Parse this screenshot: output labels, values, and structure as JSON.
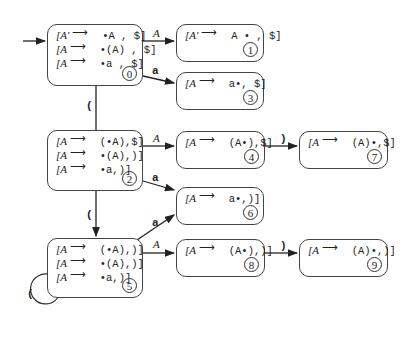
{
  "diagram": {
    "type": "LR(1) automaton",
    "states": [
      {
        "id": 0,
        "number": "0",
        "items": [
          {
            "lhs": "[A′",
            "rhs": "•A , $]"
          },
          {
            "lhs": "[A",
            "rhs": "•(A) , $]"
          },
          {
            "lhs": "[A",
            "rhs": "•a , $]"
          }
        ]
      },
      {
        "id": 1,
        "number": "1",
        "items": [
          {
            "lhs": "[A′",
            "rhs": "A • , $]"
          }
        ]
      },
      {
        "id": 2,
        "number": "2",
        "items": [
          {
            "lhs": "[A",
            "rhs": "(•A),$]"
          },
          {
            "lhs": "[A",
            "rhs": "•(A),)]"
          },
          {
            "lhs": "[A",
            "rhs": "•a,)]"
          }
        ]
      },
      {
        "id": 3,
        "number": "3",
        "items": [
          {
            "lhs": "[A",
            "rhs": "a•, $]"
          }
        ]
      },
      {
        "id": 4,
        "number": "4",
        "items": [
          {
            "lhs": "[A",
            "rhs": "(A•),$]"
          }
        ]
      },
      {
        "id": 5,
        "number": "5",
        "items": [
          {
            "lhs": "[A",
            "rhs": "(•A),)]"
          },
          {
            "lhs": "[A",
            "rhs": "•(A),)]"
          },
          {
            "lhs": "[A",
            "rhs": "•a,)]"
          }
        ]
      },
      {
        "id": 6,
        "number": "6",
        "items": [
          {
            "lhs": "[A",
            "rhs": "a•,)]"
          }
        ]
      },
      {
        "id": 7,
        "number": "7",
        "items": [
          {
            "lhs": "[A",
            "rhs": "(A)•,$]"
          }
        ]
      },
      {
        "id": 8,
        "number": "8",
        "items": [
          {
            "lhs": "[A",
            "rhs": "(A•),)]"
          }
        ]
      },
      {
        "id": 9,
        "number": "9",
        "items": [
          {
            "lhs": "[A",
            "rhs": "(A)•,)]"
          }
        ]
      }
    ],
    "transitions": [
      {
        "from": "start",
        "to": "0",
        "label": ""
      },
      {
        "from": "0",
        "to": "1",
        "label": "A"
      },
      {
        "from": "0",
        "to": "3",
        "label": "a"
      },
      {
        "from": "0",
        "to": "2",
        "label": "("
      },
      {
        "from": "2",
        "to": "4",
        "label": "A"
      },
      {
        "from": "2",
        "to": "6",
        "label": "a"
      },
      {
        "from": "2",
        "to": "5",
        "label": "("
      },
      {
        "from": "4",
        "to": "7",
        "label": ")"
      },
      {
        "from": "5",
        "to": "6",
        "label": "a"
      },
      {
        "from": "5",
        "to": "8",
        "label": "A"
      },
      {
        "from": "5",
        "to": "5",
        "label": "("
      },
      {
        "from": "8",
        "to": "9",
        "label": ")"
      }
    ],
    "arrow_symbol": "⟶"
  }
}
